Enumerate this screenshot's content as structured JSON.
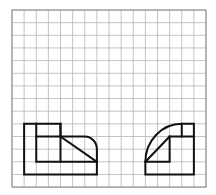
{
  "grid": {
    "cols": 16,
    "rows": 14,
    "origin_x": 12,
    "origin_y": 10,
    "cell_w": 12.125,
    "cell_h": 12.65,
    "line_color": "#b5b5b5",
    "border_color": "#8a8a8a"
  },
  "figures": [
    {
      "name": "front-view",
      "stroke": "#111111",
      "paths": [
        "M1,9 L4,9 L4,10 L6,10 A1,1 0 0 1 7,11 L7,13 L1,13 Z",
        "M2,9 L2,12 L7,12",
        "M2,10 L4,10",
        "M4,9 L4,12",
        "M4,10 L7,12"
      ]
    },
    {
      "name": "side-view",
      "stroke": "#111111",
      "paths": [
        "M11,13 L15,13 L15,9 L14,9 A3,3 0 0 0 11,12 Z",
        "M11,12 L13,12 L13,10 L15,10",
        "M14,9 L14,10",
        "M11,12 L13,10"
      ]
    }
  ]
}
